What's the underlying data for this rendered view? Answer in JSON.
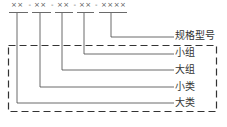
{
  "diagram": {
    "code_groups": [
      "××",
      "××",
      "××",
      "××",
      "××××"
    ],
    "separator": "-",
    "labels": [
      {
        "text": "规格型号",
        "y": 36
      },
      {
        "text": "小组",
        "y": 53
      },
      {
        "text": "大组",
        "y": 70
      },
      {
        "text": "小类",
        "y": 87
      },
      {
        "text": "大类",
        "y": 102
      }
    ],
    "line_color": "#333333"
  }
}
